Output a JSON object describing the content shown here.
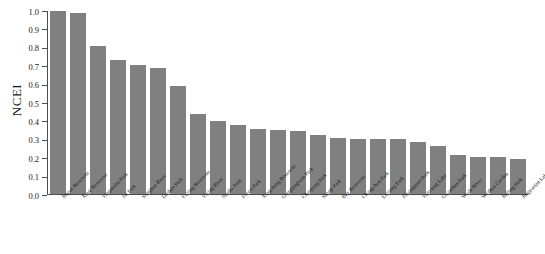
{
  "chart_data": {
    "type": "bar",
    "title": "",
    "xlabel": "",
    "ylabel": "NCEI",
    "ylim": [
      0.0,
      1.0
    ],
    "ytick_labels": [
      "0.0",
      "0.1",
      "0.2",
      "0.3",
      "0.4",
      "0.5",
      "0.6",
      "0.7",
      "0.8",
      "0.9",
      "1.0"
    ],
    "ytick_values": [
      0.0,
      0.1,
      0.2,
      0.3,
      0.4,
      0.5,
      0.6,
      0.7,
      0.8,
      0.9,
      1.0
    ],
    "grid": false,
    "legend": false,
    "bar_color": "#808080",
    "categories": [
      "Jingue Reservoir",
      "Xinsi Reservoir",
      "Yingmolin Park",
      "1st Park",
      "Songhua River",
      "Dashao Park",
      "Fuxing Reservoir",
      "Yixing River",
      "Nanhu Park",
      "Forest Park",
      "Xingcheng Reservoir",
      "Gongqingtuan Park",
      "Chaoyang Park",
      "Shanji Park",
      "Bay Reservoir",
      "Changchun Park",
      "Lexiang Park",
      "Zhuangqiao Park",
      "Yunxiang Lake",
      "Guanshan Park",
      "Wuda River",
      "Wenhua Garden",
      "Jinfeng Park",
      "Jingyuetan Lake"
    ],
    "values": [
      1.0,
      0.99,
      0.81,
      0.735,
      0.705,
      0.69,
      0.59,
      0.435,
      0.4,
      0.375,
      0.355,
      0.35,
      0.345,
      0.32,
      0.305,
      0.3,
      0.3,
      0.3,
      0.285,
      0.265,
      0.215,
      0.205,
      0.2,
      0.19
    ]
  }
}
